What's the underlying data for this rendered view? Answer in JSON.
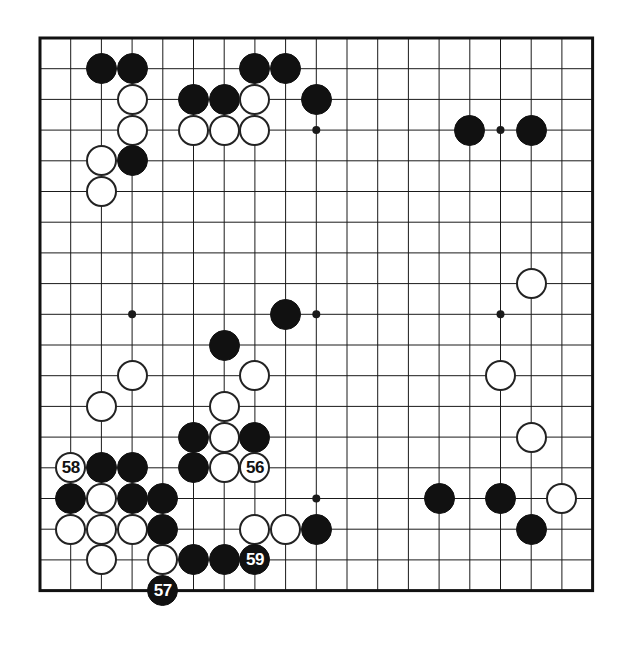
{
  "diagram": {
    "kind": "go-board-diagram",
    "board_size": 19,
    "colors": {
      "board_background": "#ffffff",
      "grid_line": "#1a1a1a",
      "border_line": "#111111",
      "black_stone": "#111111",
      "white_stone": "#ffffff",
      "white_stone_outline": "#222222",
      "black_label_text": "#ffffff",
      "white_label_text": "#111111"
    },
    "geometry": {
      "origin_x": 40,
      "origin_y": 38,
      "spacing": 30.7,
      "stone_radius": 15.5,
      "border_width": 3,
      "grid_width": 1
    },
    "star_points": [
      {
        "col": 3,
        "row": 3
      },
      {
        "col": 9,
        "row": 3
      },
      {
        "col": 15,
        "row": 3
      },
      {
        "col": 3,
        "row": 9
      },
      {
        "col": 9,
        "row": 9
      },
      {
        "col": 15,
        "row": 9
      },
      {
        "col": 3,
        "row": 15
      },
      {
        "col": 9,
        "row": 15
      },
      {
        "col": 15,
        "row": 15
      }
    ],
    "move_labels": [
      "56",
      "57",
      "58",
      "59"
    ],
    "stones": [
      {
        "col": 2,
        "row": 1,
        "color": "black",
        "label": ""
      },
      {
        "col": 3,
        "row": 1,
        "color": "black",
        "label": ""
      },
      {
        "col": 7,
        "row": 1,
        "color": "black",
        "label": ""
      },
      {
        "col": 8,
        "row": 1,
        "color": "black",
        "label": ""
      },
      {
        "col": 3,
        "row": 2,
        "color": "white",
        "label": ""
      },
      {
        "col": 5,
        "row": 2,
        "color": "black",
        "label": ""
      },
      {
        "col": 6,
        "row": 2,
        "color": "black",
        "label": ""
      },
      {
        "col": 7,
        "row": 2,
        "color": "white",
        "label": ""
      },
      {
        "col": 9,
        "row": 2,
        "color": "black",
        "label": ""
      },
      {
        "col": 3,
        "row": 3,
        "color": "white",
        "label": ""
      },
      {
        "col": 5,
        "row": 3,
        "color": "white",
        "label": ""
      },
      {
        "col": 6,
        "row": 3,
        "color": "white",
        "label": ""
      },
      {
        "col": 7,
        "row": 3,
        "color": "white",
        "label": ""
      },
      {
        "col": 14,
        "row": 3,
        "color": "black",
        "label": ""
      },
      {
        "col": 16,
        "row": 3,
        "color": "black",
        "label": ""
      },
      {
        "col": 2,
        "row": 4,
        "color": "white",
        "label": ""
      },
      {
        "col": 3,
        "row": 4,
        "color": "black",
        "label": ""
      },
      {
        "col": 2,
        "row": 5,
        "color": "white",
        "label": ""
      },
      {
        "col": 16,
        "row": 8,
        "color": "white",
        "label": ""
      },
      {
        "col": 8,
        "row": 9,
        "color": "black",
        "label": ""
      },
      {
        "col": 6,
        "row": 10,
        "color": "black",
        "label": ""
      },
      {
        "col": 3,
        "row": 11,
        "color": "white",
        "label": ""
      },
      {
        "col": 7,
        "row": 11,
        "color": "white",
        "label": ""
      },
      {
        "col": 15,
        "row": 11,
        "color": "white",
        "label": ""
      },
      {
        "col": 2,
        "row": 12,
        "color": "white",
        "label": ""
      },
      {
        "col": 6,
        "row": 12,
        "color": "white",
        "label": ""
      },
      {
        "col": 5,
        "row": 13,
        "color": "black",
        "label": ""
      },
      {
        "col": 6,
        "row": 13,
        "color": "white",
        "label": ""
      },
      {
        "col": 7,
        "row": 13,
        "color": "black",
        "label": ""
      },
      {
        "col": 16,
        "row": 13,
        "color": "white",
        "label": ""
      },
      {
        "col": 1,
        "row": 14,
        "color": "white",
        "label": "58"
      },
      {
        "col": 2,
        "row": 14,
        "color": "black",
        "label": ""
      },
      {
        "col": 3,
        "row": 14,
        "color": "black",
        "label": ""
      },
      {
        "col": 5,
        "row": 14,
        "color": "black",
        "label": ""
      },
      {
        "col": 6,
        "row": 14,
        "color": "white",
        "label": ""
      },
      {
        "col": 7,
        "row": 14,
        "color": "white",
        "label": "56"
      },
      {
        "col": 1,
        "row": 15,
        "color": "black",
        "label": ""
      },
      {
        "col": 2,
        "row": 15,
        "color": "white",
        "label": ""
      },
      {
        "col": 3,
        "row": 15,
        "color": "black",
        "label": ""
      },
      {
        "col": 4,
        "row": 15,
        "color": "black",
        "label": ""
      },
      {
        "col": 1,
        "row": 16,
        "color": "white",
        "label": ""
      },
      {
        "col": 2,
        "row": 16,
        "color": "white",
        "label": ""
      },
      {
        "col": 3,
        "row": 16,
        "color": "white",
        "label": ""
      },
      {
        "col": 4,
        "row": 16,
        "color": "black",
        "label": ""
      },
      {
        "col": 7,
        "row": 16,
        "color": "white",
        "label": ""
      },
      {
        "col": 8,
        "row": 16,
        "color": "white",
        "label": ""
      },
      {
        "col": 13,
        "row": 15,
        "color": "black",
        "label": ""
      },
      {
        "col": 15,
        "row": 15,
        "color": "black",
        "label": ""
      },
      {
        "col": 17,
        "row": 15,
        "color": "white",
        "label": ""
      },
      {
        "col": 16,
        "row": 16,
        "color": "black",
        "label": ""
      },
      {
        "col": 9,
        "row": 16,
        "color": "black",
        "label": ""
      },
      {
        "col": 2,
        "row": 17,
        "color": "white",
        "label": ""
      },
      {
        "col": 4,
        "row": 17,
        "color": "white",
        "label": ""
      },
      {
        "col": 5,
        "row": 17,
        "color": "black",
        "label": ""
      },
      {
        "col": 6,
        "row": 17,
        "color": "black",
        "label": ""
      },
      {
        "col": 7,
        "row": 17,
        "color": "black",
        "label": "59"
      },
      {
        "col": 4,
        "row": 18,
        "color": "black",
        "label": "57"
      }
    ]
  }
}
